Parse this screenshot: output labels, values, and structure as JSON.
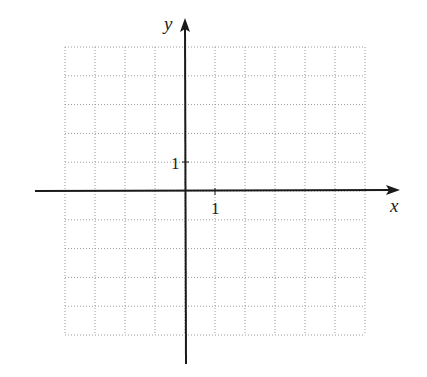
{
  "chart_data": {
    "type": "scatter",
    "title": "",
    "xlabel": "x",
    "ylabel": "y",
    "xlim": [
      -4,
      6
    ],
    "ylim": [
      -5,
      5
    ],
    "grid": true,
    "grid_style": "dotted",
    "x_tick_labels": [
      {
        "value": 1,
        "label": "1"
      }
    ],
    "y_tick_labels": [
      {
        "value": 1,
        "label": "1"
      }
    ],
    "series": []
  },
  "axes": {
    "x_label": "x",
    "y_label": "y",
    "x_unit_label": "1",
    "y_unit_label": "1"
  },
  "colors": {
    "axis": "#1a1a1a",
    "grid": "#9a9a9a",
    "background": "#ffffff"
  }
}
